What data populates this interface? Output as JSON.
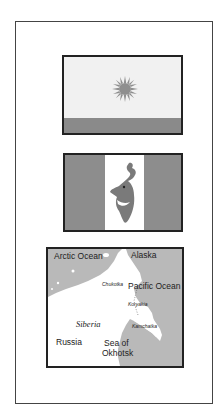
{
  "figure": {
    "flags": [
      {
        "name": "Chukotka flag",
        "colors": {
          "field": "#f1f1f1",
          "band": "#8a8a8a",
          "emblem": "#8f8f8f"
        },
        "emblem": "sun"
      },
      {
        "name": "Koryakia flag",
        "colors": {
          "side_stripes": "#8d8d8d",
          "center_stripe": "#ffffff",
          "emblem": "#7a7a7a"
        },
        "emblem": "reindeer-head"
      }
    ],
    "map": {
      "colors": {
        "water": "#b9b9b9",
        "land": "#ffffff"
      },
      "labels": {
        "arctic_ocean": "Arctic Ocean",
        "alaska": "Alaska",
        "chukotka": "Chukotka",
        "pacific_ocean": "Pacific Ocean",
        "koryakia": "Koryakia",
        "siberia": "Siberia",
        "kamchatka": "Kamchatka",
        "russia": "Russia",
        "sea_of": "Sea of",
        "okhotsk": "Okhotsk"
      }
    }
  }
}
